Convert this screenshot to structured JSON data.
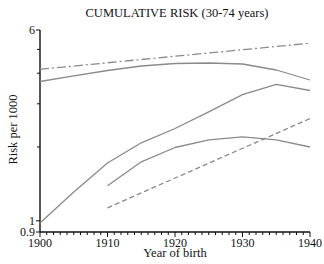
{
  "chart_data": {
    "type": "line",
    "title": "CUMULATIVE RISK (30-74 years)",
    "xlabel": "Year of birth",
    "ylabel": "Risk per 1000",
    "xlim": [
      1900,
      1940
    ],
    "ylim": [
      0.9,
      6
    ],
    "yscale": "log",
    "x_ticks": [
      "1900",
      "1910",
      "1920",
      "1930",
      "1940"
    ],
    "y_ticks": [
      "0.9",
      "1",
      "6"
    ],
    "y_minor_ticks": [
      2,
      3,
      4,
      5
    ],
    "grid": false,
    "legend": null,
    "series": [
      {
        "name": "dash-dot series",
        "style": "dashdot",
        "x": [
          1900,
          1940
        ],
        "values": [
          4.15,
          5.3
        ]
      },
      {
        "name": "upper solid series",
        "style": "solid",
        "x": [
          1900,
          1905,
          1910,
          1915,
          1920,
          1925,
          1930,
          1935,
          1940
        ],
        "values": [
          3.7,
          3.9,
          4.1,
          4.28,
          4.38,
          4.4,
          4.36,
          4.12,
          3.75
        ]
      },
      {
        "name": "steep solid series",
        "style": "solid",
        "x": [
          1900,
          1905,
          1910,
          1915,
          1920,
          1925,
          1930,
          1935,
          1940
        ],
        "values": [
          0.98,
          1.31,
          1.72,
          2.08,
          2.38,
          2.78,
          3.27,
          3.6,
          3.4
        ]
      },
      {
        "name": "lower solid series",
        "style": "solid",
        "x": [
          1910,
          1915,
          1920,
          1925,
          1930,
          1935,
          1940
        ],
        "values": [
          1.39,
          1.74,
          1.99,
          2.14,
          2.2,
          2.14,
          2.0
        ]
      },
      {
        "name": "dashed series",
        "style": "dashed",
        "x": [
          1910,
          1940
        ],
        "values": [
          1.13,
          2.61
        ]
      }
    ]
  },
  "colors": {
    "axis": "#111111",
    "line": "#8a8a8a"
  }
}
